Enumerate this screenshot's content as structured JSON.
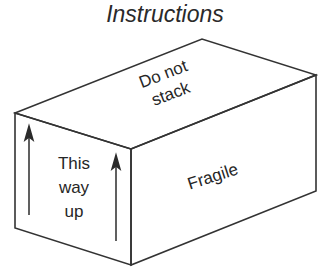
{
  "title": "Instructions",
  "box": {
    "stroke_color": "#333333",
    "faces": {
      "top": {
        "label_line1": "Do not",
        "label_line2": "stack"
      },
      "front": {
        "label_line1": "This",
        "label_line2": "way",
        "label_line3": "up"
      },
      "side": {
        "label": "Fragile"
      }
    },
    "arrows": [
      {
        "name": "left-up-arrow",
        "direction": "up"
      },
      {
        "name": "right-up-arrow",
        "direction": "up"
      }
    ]
  }
}
